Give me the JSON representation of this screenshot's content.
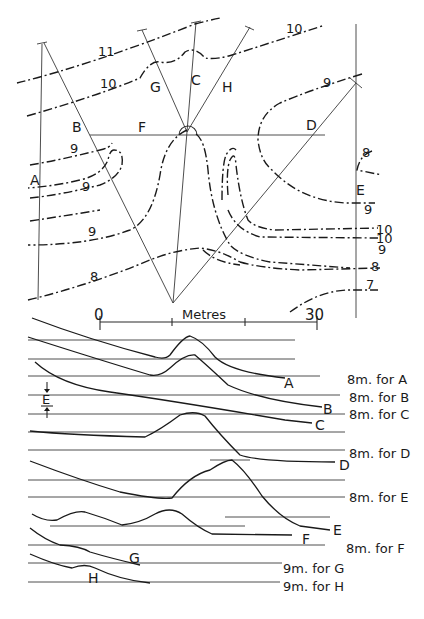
{
  "figure": {
    "map": {
      "section_lines": [
        "A",
        "B",
        "C",
        "D",
        "E",
        "F",
        "G",
        "H"
      ],
      "contour_labels": [
        "11",
        "10",
        "10",
        "9",
        "9",
        "9",
        "9",
        "8",
        "8",
        "9",
        "10",
        "10",
        "9",
        "8",
        "7"
      ],
      "scale_bar": {
        "start": "0",
        "end": "30",
        "unit": "Metres"
      }
    },
    "profiles": {
      "vertical_exaggeration_label": "E",
      "profile_labels": [
        "A",
        "B",
        "C",
        "D",
        "E",
        "F",
        "G",
        "H"
      ],
      "datum_labels": [
        "8m. for A",
        "8m. for B",
        "8m. for C",
        "8m. for D",
        "8m. for E",
        "8m. for F",
        "9m. for G",
        "9m. for H"
      ]
    }
  }
}
